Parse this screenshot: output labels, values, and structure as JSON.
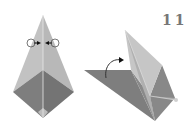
{
  "diagram": {
    "type": "origami-instruction-step",
    "step_number": "11",
    "figures": [
      {
        "id": "before",
        "description": "Kite-shaped folded paper, upper part light gray, lower diamond dark gray, with two inward squash/fold arrows at the top.",
        "colors": {
          "light_face": "#bdbdbd",
          "dark_face": "#7a7a7a",
          "crease": "#e6e6e6"
        },
        "symbols": [
          "fold-arrow-left",
          "fold-arrow-right"
        ]
      },
      {
        "id": "after",
        "description": "Paper in progress: point raised upward with curved arrow showing flap lifting.",
        "colors": {
          "light_face": "#c4c4c4",
          "dark_face": "#7d7d7d",
          "mid_face": "#9a9a9a"
        },
        "symbols": [
          "curved-lift-arrow"
        ]
      }
    ]
  }
}
